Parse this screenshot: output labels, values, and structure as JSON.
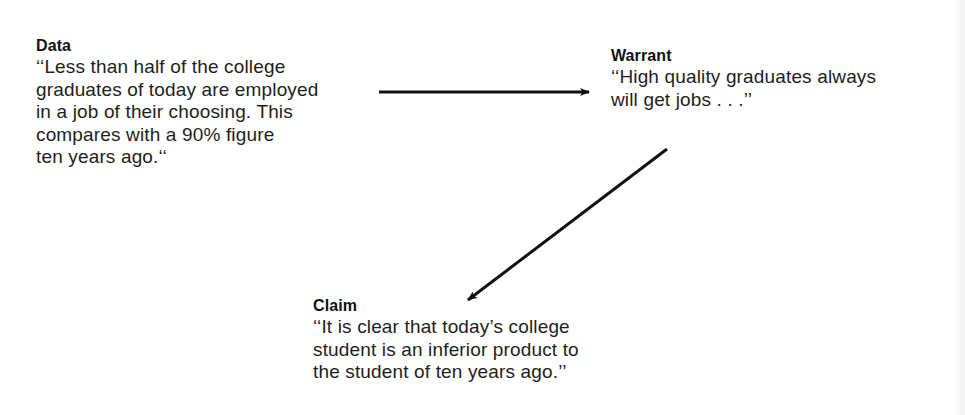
{
  "diagram": {
    "type": "argument-model",
    "nodes": {
      "data": {
        "title": "Data",
        "text": "‘‘Less than half of the college\ngraduates of today are employed\nin a job of their choosing. This\ncompares with a 90% figure\nten years ago.‘‘"
      },
      "warrant": {
        "title": "Warrant",
        "text": "‘‘High quality graduates always\nwill get jobs . . .’’"
      },
      "claim": {
        "title": "Claim",
        "text": "‘‘It is clear that today’s college\nstudent is an inferior product to\nthe student of ten years ago.’’"
      }
    },
    "edges": [
      {
        "from": "data",
        "to": "warrant",
        "x1": 379,
        "y1": 92,
        "x2": 589,
        "y2": 92
      },
      {
        "from": "warrant",
        "to": "claim",
        "x1": 667,
        "y1": 149,
        "x2": 468,
        "y2": 300
      }
    ],
    "colors": {
      "line": "#111111",
      "text": "#1e1e1e",
      "background": "#ffffff"
    }
  }
}
